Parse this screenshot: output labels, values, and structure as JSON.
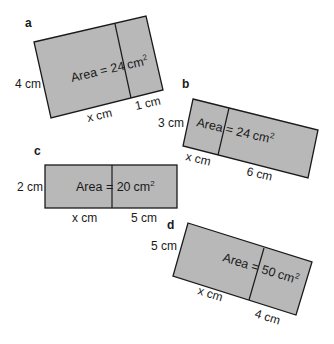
{
  "figures": [
    {
      "id": "a",
      "letter": "a",
      "area_prefix": "Area = 24",
      "area_unit": "cm",
      "area_exp": "2",
      "side_label": "4 cm",
      "bottom_left_label": "x cm",
      "bottom_right_label": "1 cm"
    },
    {
      "id": "b",
      "letter": "b",
      "area_prefix": "Area = 24",
      "area_unit": "cm",
      "area_exp": "2",
      "side_label": "3 cm",
      "bottom_left_label": "x cm",
      "bottom_right_label": "6 cm"
    },
    {
      "id": "c",
      "letter": "c",
      "area_prefix": "Area = 20",
      "area_unit": "cm",
      "area_exp": "2",
      "side_label": "2 cm",
      "bottom_left_label": "x cm",
      "bottom_right_label": "5 cm"
    },
    {
      "id": "d",
      "letter": "d",
      "area_prefix": "Area = 50",
      "area_unit": "cm",
      "area_exp": "2",
      "side_label": "5 cm",
      "bottom_left_label": "x cm",
      "bottom_right_label": "4 cm"
    }
  ],
  "colors": {
    "fill": "#b8b8b8",
    "stroke": "#1a1a1a",
    "background": "#ffffff"
  }
}
